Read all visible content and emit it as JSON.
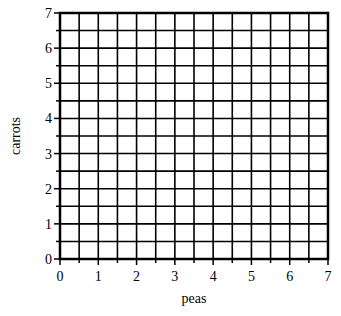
{
  "chart_data": {
    "type": "scatter",
    "title": "",
    "xlabel": "peas",
    "ylabel": "carrots",
    "xlim": [
      0,
      7
    ],
    "ylim": [
      0,
      7
    ],
    "x_ticks": [
      "0",
      "1",
      "2",
      "3",
      "4",
      "5",
      "6",
      "7"
    ],
    "y_ticks": [
      "0",
      "1",
      "2",
      "3",
      "4",
      "5",
      "6",
      "7"
    ],
    "grid": true,
    "grid_step": 0.5,
    "series": [],
    "legend": null
  }
}
